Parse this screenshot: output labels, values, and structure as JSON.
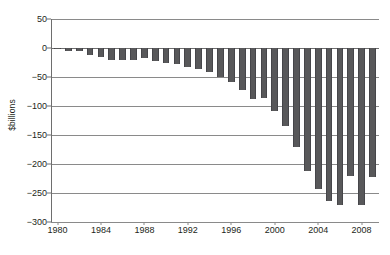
{
  "chart_data": {
    "type": "bar",
    "title": "",
    "subtitle": "",
    "xlabel": "",
    "ylabel": "$billions",
    "ylim": [
      -300,
      50
    ],
    "yticks": [
      50,
      0,
      -50,
      -100,
      -150,
      -200,
      -250,
      -300
    ],
    "ytick_labels": [
      "50",
      "0",
      "−50",
      "−100",
      "−150",
      "−200",
      "−250",
      "−300"
    ],
    "xticks": [
      1980,
      1984,
      1988,
      1992,
      1996,
      2000,
      2004,
      2008
    ],
    "xtick_labels": [
      "1980",
      "1984",
      "1988",
      "1992",
      "1996",
      "2000",
      "2004",
      "2008"
    ],
    "xlim": [
      1979.4,
      2009.6
    ],
    "grid": true,
    "grid_axis": "y",
    "legend": false,
    "legend_position": "none",
    "bar_color": "#58585a",
    "axis_color": "#6e6e6e",
    "gridline_color": "#8a8a8a",
    "text_color": "#231f20",
    "categories": [
      "1980",
      "1981",
      "1982",
      "1983",
      "1984",
      "1985",
      "1986",
      "1987",
      "1988",
      "1989",
      "1990",
      "1991",
      "1992",
      "1993",
      "1994",
      "1995",
      "1996",
      "1997",
      "1998",
      "1999",
      "2000",
      "2001",
      "2002",
      "2003",
      "2004",
      "2005",
      "2006",
      "2007",
      "2008",
      "2009"
    ],
    "values": [
      -2,
      -5,
      -6,
      -12,
      -15,
      -20,
      -20,
      -20,
      -18,
      -22,
      -25,
      -28,
      -32,
      -36,
      -42,
      -50,
      -58,
      -72,
      -88,
      -87,
      -109,
      -134,
      -170,
      -212,
      -243,
      -263,
      -270,
      -220,
      -270,
      -222
    ],
    "values_note": "bar heights in $billions, all negative (deficit)"
  },
  "axis": {
    "y_title": "$billions"
  }
}
